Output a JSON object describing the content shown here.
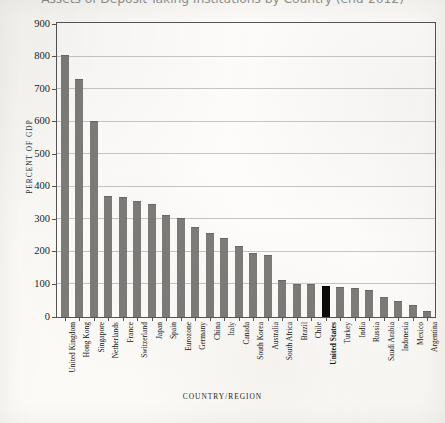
{
  "chart_data": {
    "type": "bar",
    "title": "Assets of Deposit-Taking Institutions by Country (end-2012)",
    "xlabel": "COUNTRY/REGION",
    "ylabel": "PERCENT OF GDP",
    "ylim": [
      0,
      900
    ],
    "ytick_step": 100,
    "yticks": [
      0,
      100,
      200,
      300,
      400,
      500,
      600,
      700,
      800,
      900
    ],
    "ytick_labels": [
      "0",
      "100",
      "200",
      "300",
      "400",
      "500",
      "600",
      "700",
      "800",
      "900"
    ],
    "grid": true,
    "legend": "none",
    "bar_color": "#7e7c79",
    "highlight_color": "#0b0b0b",
    "highlight_category": "United States",
    "categories": [
      "United Kingdom",
      "Hong Kong",
      "Singapore",
      "Netherlands",
      "France",
      "Switzerland",
      "Japan",
      "Spain",
      "Eurozone",
      "Germany",
      "China",
      "Italy",
      "Canada",
      "South Korea",
      "Australia",
      "South Africa",
      "Brazil",
      "Chile",
      "United States",
      "Turkey",
      "India",
      "Russia",
      "Saudi Arabia",
      "Indonesia",
      "Mexico",
      "Argentina"
    ],
    "values": [
      800,
      727,
      597,
      368,
      363,
      352,
      342,
      310,
      300,
      272,
      253,
      237,
      214,
      192,
      186,
      110,
      97,
      96,
      92,
      87,
      86,
      79,
      57,
      46,
      33,
      15
    ]
  }
}
